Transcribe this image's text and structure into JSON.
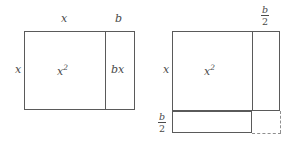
{
  "figure": {
    "ink_color": "#5a5a5a",
    "text_color": "#4a4a4a",
    "dash_color": "#8f8f8f",
    "background": "#ffffff"
  },
  "left_diagram": {
    "name": "x-squared-plus-bx-rectangle",
    "top_label_wide": "x",
    "top_label_narrow": "b",
    "side_label": "x",
    "region_main": {
      "base": "x",
      "exponent": "2"
    },
    "region_strip": "bx"
  },
  "right_diagram": {
    "name": "completed-square-diagram",
    "top_right_fraction": {
      "numerator": "b",
      "denominator": "2"
    },
    "side_label": "x",
    "bottom_left_fraction": {
      "numerator": "b",
      "denominator": "2"
    },
    "region_main": {
      "base": "x",
      "exponent": "2"
    }
  }
}
